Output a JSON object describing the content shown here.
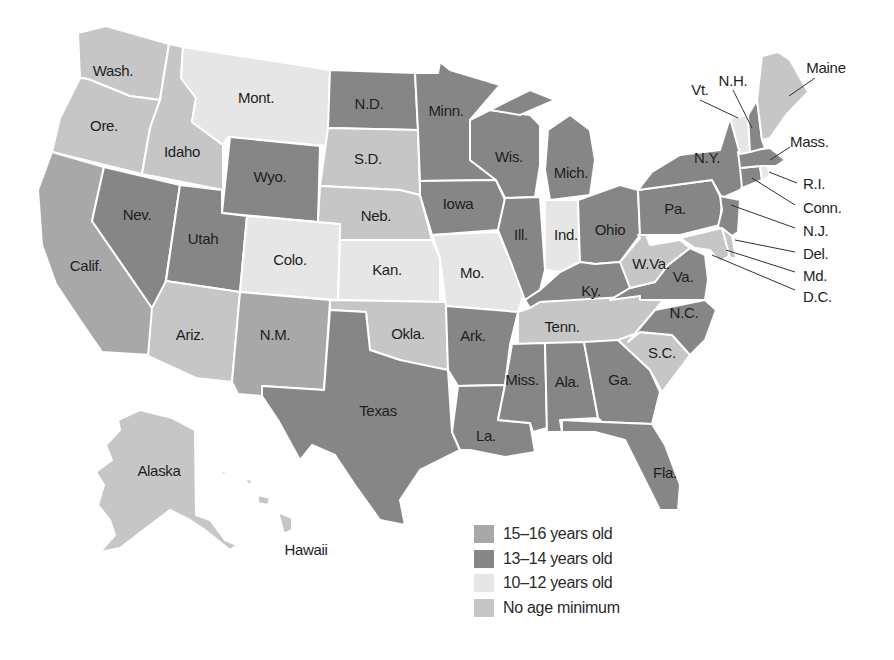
{
  "categories": {
    "c15": {
      "label": "15–16 years old",
      "color": "#a8a8a8"
    },
    "c13": {
      "label": "13–14 years old",
      "color": "#868686"
    },
    "c10": {
      "label": "10–12 years old",
      "color": "#e6e6e6"
    },
    "none": {
      "label": "No age minimum",
      "color": "#c6c6c6"
    }
  },
  "legend": [
    {
      "key": "c15",
      "label": "15–16 years old"
    },
    {
      "key": "c13",
      "label": "13–14 years old"
    },
    {
      "key": "c10",
      "label": "10–12 years old"
    },
    {
      "key": "none",
      "label": "No age minimum"
    }
  ],
  "states": {
    "wash": {
      "label": "Wash.",
      "category": "none"
    },
    "ore": {
      "label": "Ore.",
      "category": "none"
    },
    "calif": {
      "label": "Calif.",
      "category": "c15"
    },
    "idaho": {
      "label": "Idaho",
      "category": "none"
    },
    "nev": {
      "label": "Nev.",
      "category": "c13"
    },
    "mont": {
      "label": "Mont.",
      "category": "c10"
    },
    "wyo": {
      "label": "Wyo.",
      "category": "c13"
    },
    "utah": {
      "label": "Utah",
      "category": "c13"
    },
    "ariz": {
      "label": "Ariz.",
      "category": "none"
    },
    "colo": {
      "label": "Colo.",
      "category": "c10"
    },
    "nm": {
      "label": "N.M.",
      "category": "c15"
    },
    "nd": {
      "label": "N.D.",
      "category": "c13"
    },
    "sd": {
      "label": "S.D.",
      "category": "none"
    },
    "neb": {
      "label": "Neb.",
      "category": "none"
    },
    "kan": {
      "label": "Kan.",
      "category": "c10"
    },
    "okla": {
      "label": "Okla.",
      "category": "none"
    },
    "texas": {
      "label": "Texas",
      "category": "c13"
    },
    "minn": {
      "label": "Minn.",
      "category": "c13"
    },
    "iowa": {
      "label": "Iowa",
      "category": "c13"
    },
    "mo": {
      "label": "Mo.",
      "category": "c10"
    },
    "ark": {
      "label": "Ark.",
      "category": "c13"
    },
    "la": {
      "label": "La.",
      "category": "c13"
    },
    "wis": {
      "label": "Wis.",
      "category": "c13"
    },
    "ill": {
      "label": "Ill.",
      "category": "c13"
    },
    "mich": {
      "label": "Mich.",
      "category": "c13"
    },
    "ind": {
      "label": "Ind.",
      "category": "c10"
    },
    "ohio": {
      "label": "Ohio",
      "category": "c13"
    },
    "ky": {
      "label": "Ky.",
      "category": "c13"
    },
    "tenn": {
      "label": "Tenn.",
      "category": "none"
    },
    "miss": {
      "label": "Miss.",
      "category": "c13"
    },
    "ala": {
      "label": "Ala.",
      "category": "c13"
    },
    "ga": {
      "label": "Ga.",
      "category": "c13"
    },
    "fla": {
      "label": "Fla.",
      "category": "c13"
    },
    "sc": {
      "label": "S.C.",
      "category": "none"
    },
    "nc": {
      "label": "N.C.",
      "category": "c13"
    },
    "va": {
      "label": "Va.",
      "category": "c13"
    },
    "wva": {
      "label": "W.Va.",
      "category": "none"
    },
    "pa": {
      "label": "Pa.",
      "category": "c13"
    },
    "ny": {
      "label": "N.Y.",
      "category": "c13"
    },
    "nj": {
      "label": "N.J.",
      "category": "c13"
    },
    "del": {
      "label": "Del.",
      "category": "none"
    },
    "md": {
      "label": "Md.",
      "category": "none"
    },
    "dc": {
      "label": "D.C.",
      "category": "none"
    },
    "conn": {
      "label": "Conn.",
      "category": "c13"
    },
    "ri": {
      "label": "R.I.",
      "category": "c10"
    },
    "mass": {
      "label": "Mass.",
      "category": "c13"
    },
    "vt": {
      "label": "Vt.",
      "category": "c10"
    },
    "nh": {
      "label": "N.H.",
      "category": "c13"
    },
    "maine": {
      "label": "Maine",
      "category": "none"
    },
    "alaska": {
      "label": "Alaska",
      "category": "none"
    },
    "hawaii": {
      "label": "Hawaii",
      "category": "none"
    }
  }
}
